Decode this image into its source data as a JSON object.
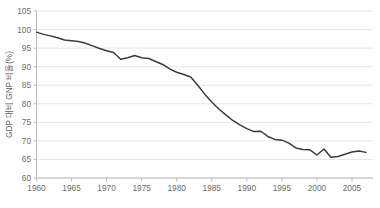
{
  "chart_data": {
    "type": "line",
    "title": "",
    "xlabel": "",
    "ylabel": "GDP 대비 GNP 비율(%)",
    "xlim": [
      1960,
      2008
    ],
    "ylim": [
      60,
      105
    ],
    "ytick_step": 5,
    "grid": true,
    "legend": "none",
    "line_color": "#3b3b3b",
    "grid_color": "#e2e2e2",
    "axis_color": "#b4b4b4",
    "xticks": [
      1960,
      1965,
      1970,
      1975,
      1980,
      1985,
      1990,
      1995,
      2000,
      2005
    ],
    "yticks": [
      60,
      65,
      70,
      75,
      80,
      85,
      90,
      95,
      100,
      105
    ],
    "series": [
      {
        "name": "GDP 대비 GNP 비율",
        "x": [
          1960,
          1961,
          1962,
          1963,
          1964,
          1965,
          1966,
          1967,
          1968,
          1969,
          1970,
          1971,
          1972,
          1973,
          1974,
          1975,
          1976,
          1977,
          1978,
          1979,
          1980,
          1981,
          1982,
          1983,
          1984,
          1985,
          1986,
          1987,
          1988,
          1989,
          1990,
          1991,
          1992,
          1993,
          1994,
          1995,
          1996,
          1997,
          1998,
          1999,
          2000,
          2001,
          2002,
          2003,
          2004,
          2005,
          2006,
          2007
        ],
        "values": [
          99.3,
          98.7,
          98.3,
          97.8,
          97.2,
          97.0,
          96.8,
          96.3,
          95.6,
          94.9,
          94.3,
          93.8,
          92.0,
          92.4,
          93.0,
          92.4,
          92.2,
          91.4,
          90.6,
          89.4,
          88.5,
          87.9,
          87.2,
          85.0,
          82.6,
          80.5,
          78.6,
          77.0,
          75.5,
          74.3,
          73.3,
          72.5,
          72.6,
          71.2,
          70.4,
          70.2,
          69.4,
          68.1,
          67.7,
          67.6,
          66.2,
          67.8,
          65.6,
          65.8,
          66.4,
          67.0,
          67.3,
          66.9
        ]
      }
    ]
  },
  "axis": {
    "y_title": "GDP 대비 GNP 비율(%)"
  }
}
